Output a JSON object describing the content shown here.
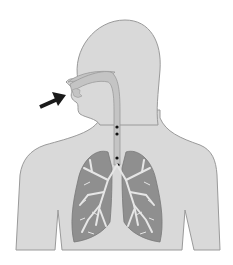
{
  "figure": {
    "title": "Human respiratory system: air entering through the nose into the airway and lungs",
    "colors": {
      "background": "#ffffff",
      "body_fill": "#d9d9d9",
      "body_outline": "#9a9a9a",
      "airway_fill": "#c4c4c4",
      "lung_fill": "#8f8f8f",
      "bronchi": "#e6e6e6",
      "arrow": "#1a1a1a",
      "particles": "#111111"
    },
    "elements": {
      "arrow": "Arrow pointing at nostril (air inflow)",
      "head": "Head silhouette",
      "torso": "Torso silhouette",
      "nasal_cavity": "Nasal cavity",
      "trachea": "Trachea",
      "particles": "Particles in trachea",
      "left_lung": "Left lung",
      "right_lung": "Right lung"
    },
    "particle_count": 4
  }
}
